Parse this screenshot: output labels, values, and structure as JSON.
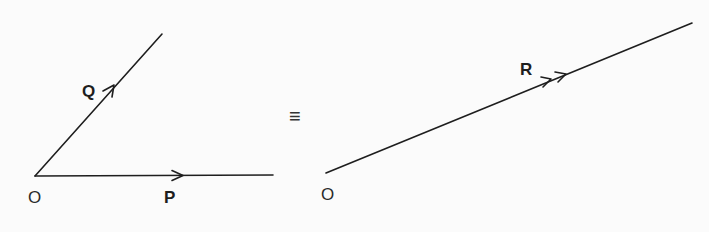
{
  "diagram": {
    "left": {
      "origin_label": "O",
      "vector_p": {
        "label": "P",
        "arrow": "single"
      },
      "vector_q": {
        "label": "Q",
        "arrow": "single"
      }
    },
    "equivalence_symbol": "≡",
    "right": {
      "origin_label": "O",
      "vector_r": {
        "label": "R",
        "arrow": "double"
      }
    },
    "colors": {
      "line": "#1e1e1e",
      "background": "#fbfbfb"
    }
  }
}
